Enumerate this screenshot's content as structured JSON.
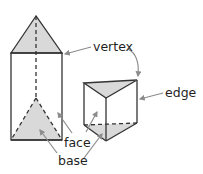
{
  "diagram": {
    "labels": {
      "vertex": "vertex",
      "edge": "edge",
      "face": "face",
      "base": "base"
    },
    "colors": {
      "stroke": "#333333",
      "fill": "#d9d9d9",
      "arrow": "#8c8c8c",
      "text": "#1f1f1f"
    }
  }
}
